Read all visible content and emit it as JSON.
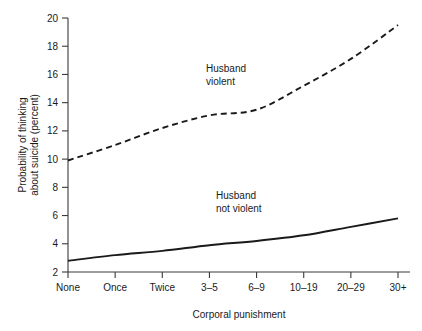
{
  "chart_data": {
    "type": "line",
    "title": "",
    "xlabel": "Corporal punishment",
    "ylabel_line1": "Probability of thinking",
    "ylabel_line2": "about suicide (percent)",
    "categories": [
      "None",
      "Once",
      "Twice",
      "3–5",
      "6–9",
      "10–19",
      "20–29",
      "30+"
    ],
    "ylim": [
      2,
      20
    ],
    "yticks": [
      2,
      4,
      6,
      8,
      10,
      12,
      14,
      16,
      18,
      20
    ],
    "ytick_labels": [
      "2",
      "4",
      "6",
      "8",
      "10",
      "12",
      "14",
      "16",
      "18",
      "20"
    ],
    "grid": false,
    "legend_position": "inline-annotation",
    "series": [
      {
        "name": "Husband violent",
        "style": "dashed",
        "color": "#1a1a1a",
        "values": [
          9.9,
          11.0,
          12.2,
          13.1,
          13.5,
          15.2,
          17.1,
          19.5
        ],
        "annotation_line1": "Husband",
        "annotation_line2": "violent"
      },
      {
        "name": "Husband not violent",
        "style": "solid",
        "color": "#1a1a1a",
        "values": [
          2.8,
          3.2,
          3.5,
          3.9,
          4.2,
          4.6,
          5.2,
          5.8
        ],
        "annotation_line1": "Husband",
        "annotation_line2": "not violent"
      }
    ]
  }
}
